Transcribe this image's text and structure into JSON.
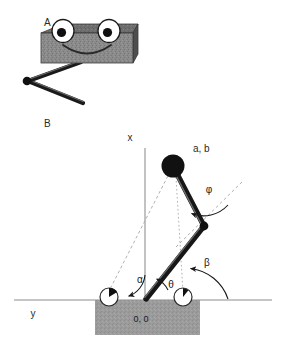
{
  "figure": {
    "panels": [
      {
        "id": "A",
        "label": "A",
        "description": "robot body with eyes and two-segment leg"
      },
      {
        "id": "B",
        "label": "B",
        "description": "kinematic diagram of hopping robot"
      }
    ]
  },
  "panelA": {
    "label": "A",
    "body_color": "#8a8a8a",
    "body_top_color": "#6f6f6f",
    "body_side_color": "#4e4e4e",
    "eye_fill": "#ffffff",
    "pupil_fill": "#111111",
    "leg_color": "#1a1a1a",
    "mouth_color": "#2a2a2a"
  },
  "panelB": {
    "label": "B",
    "axis_x_label": "x",
    "axis_y_label": "y",
    "mass_label": "a, b",
    "origin_label": "0, 0",
    "angles": {
      "alpha": "α",
      "beta": "β",
      "theta": "θ",
      "phi": "φ"
    },
    "colors": {
      "ground_line": "#8c8c8c",
      "axis_line": "#9a9a9a",
      "block_fill": "#9b9b9b",
      "limb": "#171717",
      "mass_fill": "#111111",
      "foot_fill": "#ffffff",
      "foot_stroke": "#2a2a2a",
      "wedge_fill": "#111111",
      "dashed": "#a8a8a8",
      "arc": "#1a1a1a"
    },
    "geometry": {
      "origin": [
        145,
        300
      ],
      "mass_center": [
        173,
        166
      ],
      "mass_radius": 11,
      "knee": [
        203,
        226
      ],
      "foot_left": [
        109,
        297
      ],
      "foot_right": [
        183,
        297
      ],
      "foot_radius": 9,
      "ground_y": 300,
      "block": [
        95,
        300,
        105,
        35
      ],
      "axis_top_y": 148
    }
  }
}
